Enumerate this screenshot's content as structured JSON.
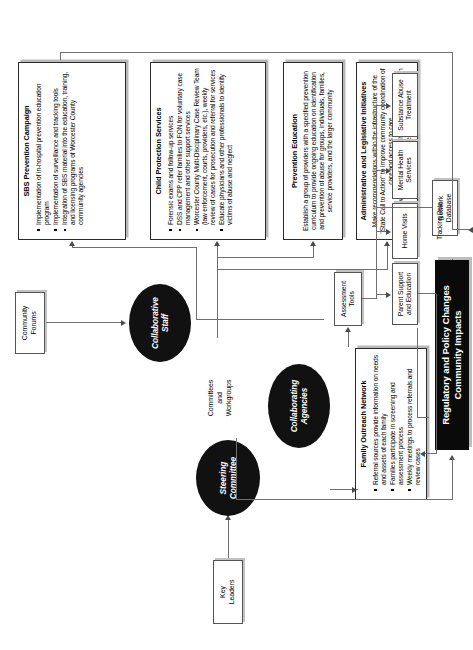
{
  "diagram": {
    "title_black_bar": "Regulatory and Policy Changes\nCommunity Impacts",
    "entry": {
      "key_leaders": "Key\nLeaders",
      "community_forums": "Community\nForums"
    },
    "ovals": [
      {
        "id": "steering-committee",
        "label": "Steering\nCommittee"
      },
      {
        "id": "collaborative-staff",
        "label": "Collaborative\nStaff"
      },
      {
        "id": "collaborating-agencies",
        "label": "Collaborating\nAgencies"
      }
    ],
    "committees_label": "Committees\nand\nWorkgroups",
    "tracking_data_label": "Tracking Data",
    "program_boxes": [
      {
        "id": "sbs-prevention-campaign",
        "title": "SBS Prevention Campaign",
        "bullets": [
          "Implementation of in-hospital prevention education program",
          "Implementation of surveillance and tracking tools",
          "Integration of SBS material into the education, training, and licensing programs of Worcester County community agencies"
        ]
      },
      {
        "id": "child-protection-services",
        "title": "Child Protection Services",
        "bullets": [
          "Forensic exams and follow-up services",
          "DSS and CPP refer families to FON for voluntary case management and other support services",
          "Worcester County Multi-Disciplinary Case Review Team (law enforcement, courts, providers, etc.), weekly review of cases for prosecution and referral for services",
          "Educate physicians and other professionals to identify victims of abuse and neglect"
        ]
      },
      {
        "id": "prevention-education",
        "title": "Prevention Education",
        "paragraphs": [
          "Establish a group of providers with a specified prevention curriculum to provide ongoing education on identification and prevention of abuse for groups, individuals, families, service providers, and the larger community"
        ]
      },
      {
        "id": "administrative-and-legislative-initiatives",
        "title": "Administrative and Legislative Initiatives",
        "paragraphs": [
          "Make recommendations within the infrastructure of the \"State Call to Action\" to improve community coordination of care and access to care",
          "Work to advance legislation on behalf of victimized children and families"
        ]
      },
      {
        "id": "family-outreach-network",
        "title": "Family Outreach Network",
        "bullets": [
          "Referral sources provide information on needs and assets of each family",
          "Families participate in screening and assessment process",
          "Weekly meetings to process referrals and review cases"
        ]
      }
    ],
    "service_boxes": [
      {
        "id": "assessment-tools",
        "label": "Assessment\nTools"
      },
      {
        "id": "network-database",
        "label": "Network\nDatabase"
      },
      {
        "id": "parent-support-and-education",
        "label": "Parent Support\nand Education"
      },
      {
        "id": "home-visits",
        "label": "Home Visits"
      },
      {
        "id": "mental-health-services",
        "label": "Mental Health\nServices"
      },
      {
        "id": "substance-abuse-treatment",
        "label": "Substance Abuse\nTreatment"
      }
    ],
    "colors": {
      "oval_fill": "#111111",
      "black_bar_fill": "#0a0a0a",
      "box_border": "#2b2b2b",
      "connector": "#6f6f6f",
      "shadow": "#b9b9b9"
    }
  }
}
